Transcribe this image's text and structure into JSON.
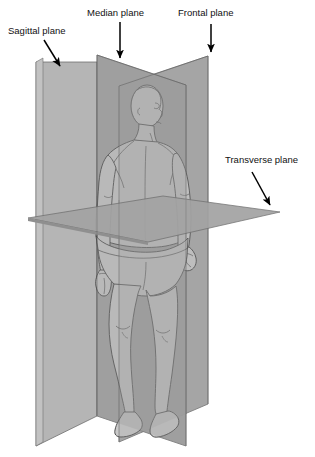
{
  "diagram": {
    "background_color": "#ffffff",
    "labels": [
      {
        "id": "sagittal",
        "text": "Sagittal plane",
        "text_x": 8,
        "text_y": 34,
        "arrow": {
          "x1": 44,
          "y1": 40,
          "x2": 60,
          "y2": 66
        }
      },
      {
        "id": "median",
        "text": "Median plane",
        "text_x": 87,
        "text_y": 16,
        "arrow": {
          "x1": 120,
          "y1": 22,
          "x2": 120,
          "y2": 58
        }
      },
      {
        "id": "frontal",
        "text": "Frontal plane",
        "text_x": 178,
        "text_y": 16,
        "arrow": {
          "x1": 211,
          "y1": 24,
          "x2": 211,
          "y2": 52
        }
      },
      {
        "id": "transverse",
        "text": "Transverse plane",
        "text_x": 225,
        "text_y": 163,
        "arrow": {
          "x1": 252,
          "y1": 172,
          "x2": 270,
          "y2": 205
        }
      }
    ],
    "planes": [
      {
        "id": "sagittal-plane",
        "name": "sagittal-plane",
        "fill": "#b5b5b5",
        "stroke": "#6f6f6f",
        "points": "36,62 97,62 97,416 36,446"
      },
      {
        "id": "frontal-plane",
        "name": "frontal-plane",
        "fill": "#a8a8a8",
        "stroke": "#6f6f6f",
        "points": "119,86 208,56 208,404 119,442"
      },
      {
        "id": "median-plane",
        "name": "median-plane",
        "fill": "#9e9e9e",
        "stroke": "#6b6b6b",
        "points": "97,55 186,85 186,446 97,416"
      },
      {
        "id": "transverse-plane",
        "name": "transverse-plane",
        "fill": "#a3a3a3",
        "stroke": "#6f6f6f",
        "points": "28,218 163,196 280,212 148,242"
      }
    ],
    "body": {
      "id": "human-figure",
      "fill": "#c9c9c9",
      "stroke": "#3d3d3d",
      "pose": "anatomical position, three-quarter view, standing"
    },
    "colors": {
      "label_text": "#111111",
      "arrow": "#000000",
      "plane_light": "#b5b5b5",
      "plane_mid": "#a8a8a8",
      "plane_dark": "#9e9e9e",
      "body_fill": "#c9c9c9",
      "body_outline": "#3d3d3d"
    }
  }
}
